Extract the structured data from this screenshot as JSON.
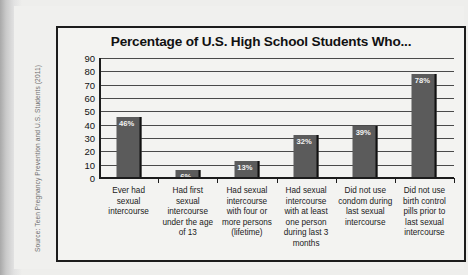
{
  "chart_data": {
    "type": "bar",
    "title": "Percentage of U.S. High School Students Who...",
    "xlabel": "",
    "ylabel": "",
    "ylim": [
      0,
      90
    ],
    "ytick_step": 10,
    "yticks": [
      90,
      80,
      70,
      60,
      50,
      40,
      30,
      20,
      10,
      0
    ],
    "grid": true,
    "legend": false,
    "categories": [
      [
        "Ever had",
        "sexual",
        "intercourse"
      ],
      [
        "Had first",
        "sexual",
        "intercourse",
        "under the age",
        "of 13"
      ],
      [
        "Had sexual",
        "intercourse",
        "with four or",
        "more persons",
        "(lifetime)"
      ],
      [
        "Had sexual",
        "intercourse",
        "with at least",
        "one person",
        "during last 3",
        "months"
      ],
      [
        "Did not use",
        "condom during",
        "last sexual",
        "intercourse"
      ],
      [
        "Did not use",
        "birth control",
        "pills prior to",
        "last sexual",
        "intercourse"
      ]
    ],
    "values": [
      46,
      6,
      13,
      32,
      39,
      78
    ],
    "value_labels": [
      "46%",
      "6%",
      "13%",
      "32%",
      "39%",
      "78%"
    ],
    "bar_color": "#5b5b5b",
    "plot_background": "#f3f3f1",
    "gridline_color": "#4a4a4a"
  },
  "source_note": "Source: Teen Pregnancy Prevention and U.S. Students (2011)"
}
